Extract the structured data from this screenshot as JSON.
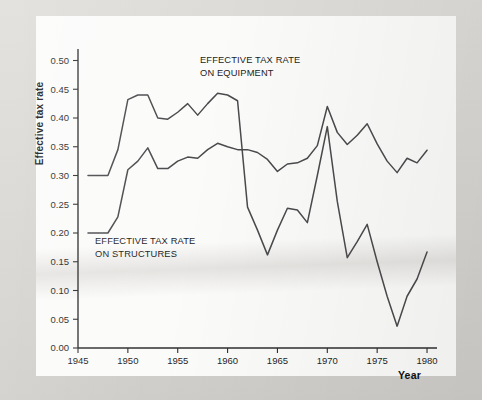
{
  "figure": {
    "ylabel": "Effective tax rate",
    "xlabel": "Year",
    "annotation_equipment_line1": "EFFECTIVE TAX RATE",
    "annotation_equipment_line2": "ON EQUIPMENT",
    "annotation_structures_line1": "EFFECTIVE TAX RATE",
    "annotation_structures_line2": "ON STRUCTURES",
    "line_color": "#4a4a4c",
    "axis_color": "#2e2e2e",
    "plot_background": "#fbfbfa",
    "page_background": "#d8d6d2"
  },
  "chart_data": {
    "type": "line",
    "title": "",
    "xlabel": "Year",
    "ylabel": "Effective tax rate",
    "xlim": [
      1945,
      1981
    ],
    "ylim": [
      0.0,
      0.52
    ],
    "xticks": [
      1945,
      1950,
      1955,
      1960,
      1965,
      1970,
      1975,
      1980
    ],
    "xticklabels": [
      "1945",
      "1950",
      "1955",
      "1960",
      "1965",
      "1970",
      "1975",
      "1980"
    ],
    "yticks": [
      0.0,
      0.05,
      0.1,
      0.15,
      0.2,
      0.25,
      0.3,
      0.35,
      0.4,
      0.45,
      0.5
    ],
    "yticklabels": [
      "0.00",
      "0.05",
      "0.10",
      "0.15",
      "0.20",
      "0.25",
      "0.30",
      "0.35",
      "0.40",
      "0.45",
      "0.50"
    ],
    "grid": false,
    "legend": "annotations-inline",
    "x": [
      1946,
      1947,
      1948,
      1949,
      1950,
      1951,
      1952,
      1953,
      1954,
      1955,
      1956,
      1957,
      1958,
      1959,
      1960,
      1961,
      1962,
      1963,
      1964,
      1965,
      1966,
      1967,
      1968,
      1969,
      1970,
      1971,
      1972,
      1973,
      1974,
      1975,
      1976,
      1977,
      1978,
      1979,
      1980
    ],
    "series": [
      {
        "name": "EFFECTIVE TAX RATE ON EQUIPMENT",
        "values": [
          0.3,
          0.3,
          0.3,
          0.345,
          0.432,
          0.44,
          0.44,
          0.4,
          0.398,
          0.41,
          0.425,
          0.405,
          0.425,
          0.443,
          0.44,
          0.43,
          0.245,
          0.205,
          0.162,
          0.205,
          0.243,
          0.24,
          0.218,
          0.3,
          0.385,
          0.255,
          0.157,
          0.185,
          0.215,
          0.15,
          0.09,
          0.038,
          0.09,
          0.12,
          0.167
        ]
      },
      {
        "name": "EFFECTIVE TAX RATE ON STRUCTURES",
        "values": [
          0.2,
          0.2,
          0.2,
          0.228,
          0.31,
          0.325,
          0.348,
          0.312,
          0.312,
          0.325,
          0.332,
          0.33,
          0.345,
          0.356,
          0.35,
          0.345,
          0.345,
          0.34,
          0.328,
          0.307,
          0.32,
          0.322,
          0.33,
          0.352,
          0.42,
          0.375,
          0.354,
          0.37,
          0.39,
          0.355,
          0.325,
          0.305,
          0.33,
          0.322,
          0.344
        ]
      }
    ],
    "annotations": [
      {
        "text": "EFFECTIVE TAX RATE ON EQUIPMENT",
        "x": 1957,
        "y": 0.49
      },
      {
        "text": "EFFECTIVE TAX RATE ON STRUCTURES",
        "x": 1949,
        "y": 0.18
      }
    ]
  }
}
